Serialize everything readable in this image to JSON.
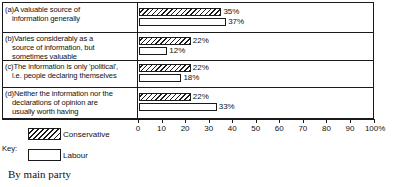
{
  "chart_data": {
    "type": "bar",
    "orientation": "horizontal",
    "title": "",
    "caption": "By main party",
    "xlabel": "",
    "ylabel": "",
    "xlim": [
      0,
      100
    ],
    "grid": false,
    "legend_position": "bottom-left",
    "legend_title": "Key:",
    "axis_ticks": [
      {
        "value": 0,
        "label": "0"
      },
      {
        "value": 10,
        "label": "10"
      },
      {
        "value": 20,
        "label": "20"
      },
      {
        "value": 30,
        "label": "30"
      },
      {
        "value": 40,
        "label": "40"
      },
      {
        "value": 50,
        "label": "50"
      },
      {
        "value": 60,
        "label": "60"
      },
      {
        "value": 70,
        "label": "70"
      },
      {
        "value": 80,
        "label": "80"
      },
      {
        "value": 90,
        "label": "90"
      },
      {
        "value": 100,
        "label": "100%"
      }
    ],
    "categories": [
      {
        "key": "(a)",
        "lead": "(a)A valuable source of",
        "cont": [
          "information generally"
        ]
      },
      {
        "key": "(b)",
        "lead": "(b)Varies considerably as a",
        "cont": [
          "source of information, but",
          "sometimes valuable"
        ]
      },
      {
        "key": "(c)",
        "lead": "(c)The information is only 'political',",
        "cont": [
          "i.e. people declaring themselves"
        ]
      },
      {
        "key": "(d)",
        "lead": "(d)Neither the information nor the",
        "cont": [
          "declarations of opinion are",
          "usually worth having"
        ]
      }
    ],
    "series": [
      {
        "name": "Conservative",
        "pattern": "diagonal-hatch",
        "color": "#1a1a1a",
        "values": [
          35,
          22,
          22,
          22
        ],
        "labels": [
          "35%",
          "22%",
          "22%",
          "22%"
        ]
      },
      {
        "name": "Labour",
        "pattern": "solid-white",
        "color": "#ffffff",
        "values": [
          37,
          12,
          18,
          33
        ],
        "labels": [
          "37%",
          "12%",
          "18%",
          "33%"
        ]
      }
    ]
  }
}
